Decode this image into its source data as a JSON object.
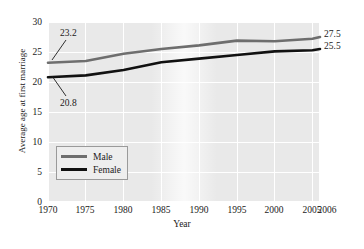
{
  "chart_data": {
    "type": "line",
    "title": "",
    "xlabel": "Year",
    "ylabel": "Average age at first marriage",
    "xlim": [
      1970,
      2006
    ],
    "ylim": [
      0,
      30
    ],
    "grid": true,
    "legend_position": "lower-left inside axes",
    "x_ticks": [
      "1970",
      "1975",
      "1980",
      "1985",
      "1990",
      "1995",
      "2000",
      "2005",
      "2006"
    ],
    "y_ticks": [
      "0",
      "5",
      "10",
      "15",
      "20",
      "25",
      "30"
    ],
    "x": [
      1970,
      1975,
      1980,
      1985,
      1990,
      1995,
      2000,
      2005,
      2006
    ],
    "series": [
      {
        "name": "Male",
        "color": "#6e6e6e",
        "values": [
          23.2,
          23.5,
          24.7,
          25.5,
          26.1,
          26.9,
          26.8,
          27.2,
          27.5
        ]
      },
      {
        "name": "Female",
        "color": "#111111",
        "values": [
          20.8,
          21.1,
          22.0,
          23.3,
          23.9,
          24.5,
          25.1,
          25.3,
          25.5
        ]
      }
    ],
    "annotations": [
      {
        "text": "23.2",
        "series": "Male",
        "x": 1970,
        "y": 23.2,
        "side": "left"
      },
      {
        "text": "20.8",
        "series": "Female",
        "x": 1970,
        "y": 20.8,
        "side": "left"
      },
      {
        "text": "27.5",
        "series": "Male",
        "x": 2006,
        "y": 27.5,
        "side": "right"
      },
      {
        "text": "25.5",
        "series": "Female",
        "x": 2006,
        "y": 25.5,
        "side": "right"
      }
    ],
    "colors": {
      "plot_background": "#e9e9e9",
      "gridline": "#ffffff",
      "male_line": "#6e6e6e",
      "female_line": "#111111",
      "legend_border": "#9a9a9a",
      "text": "#1a1a1a"
    }
  },
  "legend": {
    "items": [
      {
        "label": "Male"
      },
      {
        "label": "Female"
      }
    ]
  },
  "axes": {
    "x_title": "Year",
    "y_title": "Average age at first marriage"
  }
}
